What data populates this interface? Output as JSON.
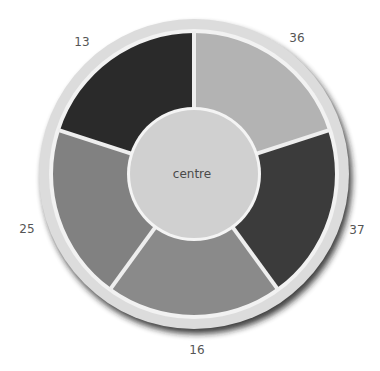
{
  "chart_data": {
    "type": "pie",
    "variant": "donut-segmented",
    "title": "",
    "center_label": "centre",
    "slices": [
      {
        "label": "36",
        "value": 36,
        "color": "#b3b3b3",
        "start_deg": -90,
        "end_deg": -18,
        "label_pos": [
          297,
          42
        ]
      },
      {
        "label": "37",
        "value": 37,
        "color": "#3b3b3b",
        "start_deg": -18,
        "end_deg": 54,
        "label_pos": [
          357,
          234
        ]
      },
      {
        "label": "16",
        "value": 16,
        "color": "#8a8a8a",
        "start_deg": 54,
        "end_deg": 126,
        "label_pos": [
          197,
          354
        ]
      },
      {
        "label": "25",
        "value": 25,
        "color": "#818181",
        "start_deg": 126,
        "end_deg": 198,
        "label_pos": [
          27,
          233
        ]
      },
      {
        "label": "13",
        "value": 13,
        "color": "#2a2a2a",
        "start_deg": 198,
        "end_deg": 270,
        "label_pos": [
          82,
          46
        ]
      }
    ],
    "geometry": {
      "cx": 194,
      "cy": 174,
      "ring_r": 155,
      "outer_r": 141,
      "inner_r": 66
    },
    "colors": {
      "ring": "#dcdcdc",
      "ring_inner": "#f2f2f2",
      "centre": "#d0d0d0",
      "divider": "#eeeeee",
      "shadow": "#1e1e1e"
    }
  }
}
